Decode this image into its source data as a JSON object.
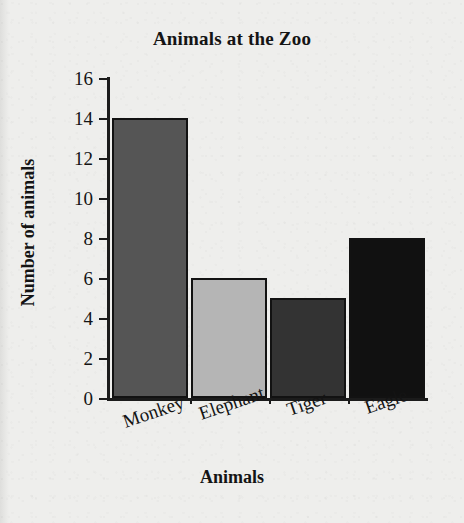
{
  "chart_data": {
    "type": "bar",
    "title": "Animals at the Zoo",
    "xlabel": "Animals",
    "ylabel": "Number of animals",
    "categories": [
      "Monkey",
      "Elephant",
      "Tiger",
      "Eagle"
    ],
    "values": [
      14,
      6,
      5,
      8
    ],
    "ylim": [
      0,
      16
    ],
    "ytick_step": 2,
    "ytick_labels": [
      "16",
      "14",
      "12",
      "10",
      "8",
      "6",
      "4",
      "2",
      "0"
    ],
    "grid": false,
    "legend": false,
    "bar_colors": [
      "#555555",
      "#b5b5b5",
      "#333333",
      "#111111"
    ],
    "bar_edge_color": "#121212",
    "axis_color": "#1b1b1b",
    "text_color": "#141414",
    "background_color": "#eeeeec",
    "category_label_rotation_deg": -19
  }
}
